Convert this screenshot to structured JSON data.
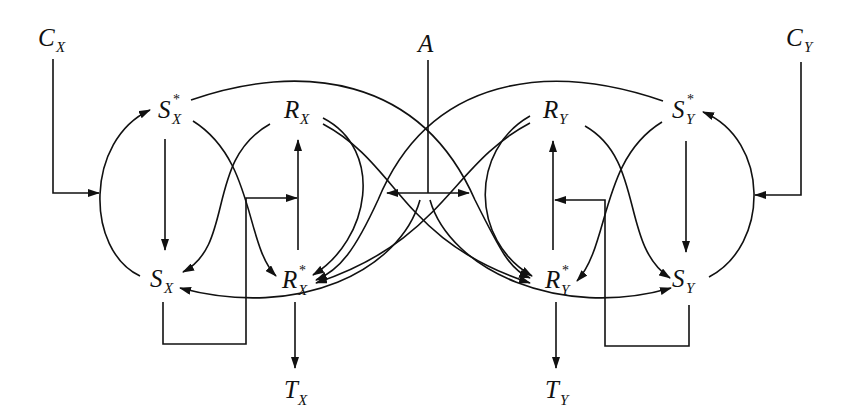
{
  "diagram": {
    "type": "signaling-network",
    "nodes": {
      "CX": {
        "main": "C",
        "sub": "X",
        "sup": ""
      },
      "CY": {
        "main": "C",
        "sub": "Y",
        "sup": ""
      },
      "A": {
        "main": "A",
        "sub": "",
        "sup": ""
      },
      "SXs": {
        "main": "S",
        "sub": "X",
        "sup": "*"
      },
      "SX": {
        "main": "S",
        "sub": "X",
        "sup": ""
      },
      "RX": {
        "main": "R",
        "sub": "X",
        "sup": ""
      },
      "RXs": {
        "main": "R",
        "sub": "X",
        "sup": "*"
      },
      "TX": {
        "main": "T",
        "sub": "X",
        "sup": ""
      },
      "RY": {
        "main": "R",
        "sub": "Y",
        "sup": ""
      },
      "RYs": {
        "main": "R",
        "sub": "Y",
        "sup": "*"
      },
      "TY": {
        "main": "T",
        "sub": "Y",
        "sup": ""
      },
      "SYs": {
        "main": "S",
        "sub": "Y",
        "sup": "*"
      },
      "SY": {
        "main": "S",
        "sub": "Y",
        "sup": ""
      }
    },
    "edges": [
      {
        "from": "CX",
        "to": "SX->SXs arc",
        "kind": "catalysis"
      },
      {
        "from": "SX",
        "to": "SXs",
        "kind": "conversion"
      },
      {
        "from": "SXs",
        "to": "SX",
        "kind": "conversion"
      },
      {
        "from": "SXs",
        "to": "RXs",
        "kind": "phosphotransfer"
      },
      {
        "from": "SXs",
        "to": "RYs",
        "kind": "cross-talk"
      },
      {
        "from": "RX",
        "to": "SX",
        "kind": "conversion"
      },
      {
        "from": "RX",
        "to": "RXs",
        "kind": "conversion"
      },
      {
        "from": "RX",
        "to": "RYs",
        "kind": "conversion"
      },
      {
        "from": "RXs",
        "to": "RX",
        "kind": "dephosphorylation"
      },
      {
        "from": "SX",
        "to": "RXs->RX arrow",
        "kind": "feedback"
      },
      {
        "from": "RXs",
        "to": "TX",
        "kind": "output"
      },
      {
        "from": "A",
        "to": "RX-arcs",
        "kind": "catalysis"
      },
      {
        "from": "A",
        "to": "RY-arcs",
        "kind": "catalysis"
      },
      {
        "from": "RY",
        "to": "RYs",
        "kind": "conversion"
      },
      {
        "from": "RY",
        "to": "RXs",
        "kind": "conversion"
      },
      {
        "from": "RY",
        "to": "SY",
        "kind": "conversion"
      },
      {
        "from": "RYs",
        "to": "RY",
        "kind": "dephosphorylation"
      },
      {
        "from": "SY",
        "to": "RYs->RY arrow",
        "kind": "feedback"
      },
      {
        "from": "RYs",
        "to": "TY",
        "kind": "output"
      },
      {
        "from": "SYs",
        "to": "SY",
        "kind": "conversion"
      },
      {
        "from": "SY",
        "to": "SYs",
        "kind": "conversion"
      },
      {
        "from": "SYs",
        "to": "RXs",
        "kind": "cross-talk"
      },
      {
        "from": "SYs",
        "to": "RYs",
        "kind": "phosphotransfer"
      },
      {
        "from": "CY",
        "to": "SY->SYs arc",
        "kind": "catalysis"
      },
      {
        "from": "RXs",
        "to": "SX",
        "kind": "cross arc from right"
      },
      {
        "from": "RYs",
        "to": "SY",
        "kind": "cross arc from left"
      }
    ]
  }
}
